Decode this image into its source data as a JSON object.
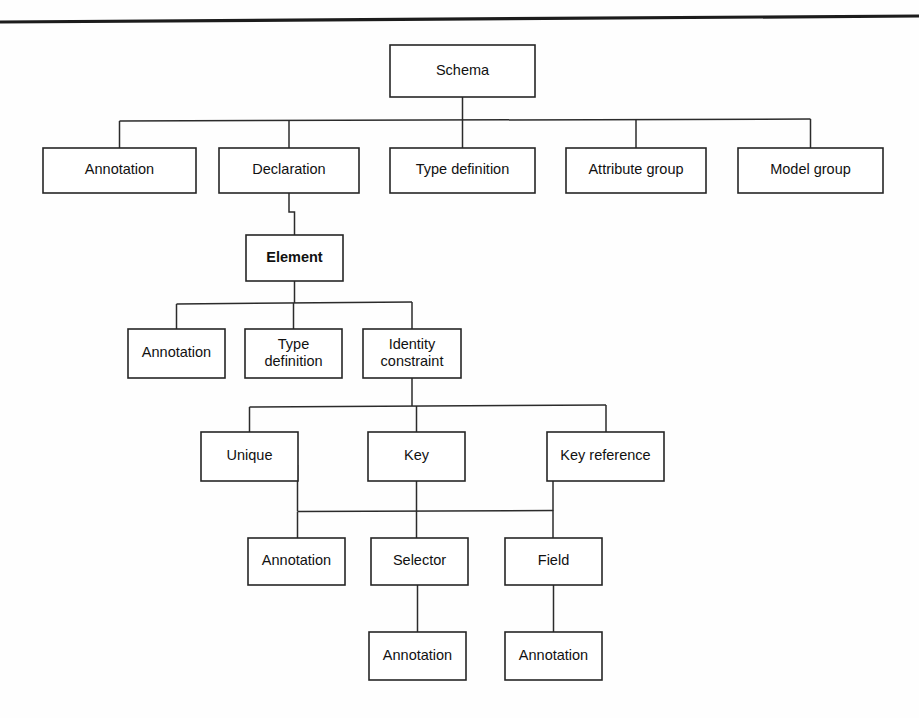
{
  "diagram": {
    "background_color": "#fefefe",
    "line_color": "#2b2b2b",
    "box_fill": "#ffffff",
    "top_rule": {
      "name": "page-header-rule",
      "x1": 0,
      "y1": 22,
      "x2": 919,
      "y2": 16
    },
    "nodes": [
      {
        "id": "schema",
        "label": "Schema",
        "x": 390,
        "y": 45,
        "w": 145,
        "h": 52,
        "bold": false,
        "lines": [
          "Schema"
        ]
      },
      {
        "id": "annotation-1",
        "label": "Annotation",
        "x": 43,
        "y": 148,
        "w": 153,
        "h": 45,
        "bold": false,
        "lines": [
          "Annotation"
        ]
      },
      {
        "id": "declaration",
        "label": "Declaration",
        "x": 219,
        "y": 148,
        "w": 140,
        "h": 45,
        "bold": false,
        "lines": [
          "Declaration"
        ]
      },
      {
        "id": "type-definition-1",
        "label": "Type definition",
        "x": 390,
        "y": 148,
        "w": 145,
        "h": 45,
        "bold": false,
        "lines": [
          "Type definition"
        ]
      },
      {
        "id": "attribute-group",
        "label": "Attribute group",
        "x": 566,
        "y": 148,
        "w": 140,
        "h": 45,
        "bold": false,
        "lines": [
          "Attribute group"
        ]
      },
      {
        "id": "model-group",
        "label": "Model group",
        "x": 738,
        "y": 148,
        "w": 145,
        "h": 45,
        "bold": false,
        "lines": [
          "Model group"
        ]
      },
      {
        "id": "element",
        "label": "Element",
        "x": 246,
        "y": 235,
        "w": 97,
        "h": 46,
        "bold": true,
        "lines": [
          "Element"
        ]
      },
      {
        "id": "annotation-2",
        "label": "Annotation",
        "x": 128,
        "y": 329,
        "w": 97,
        "h": 49,
        "bold": false,
        "lines": [
          "Annotation"
        ]
      },
      {
        "id": "type-definition-2",
        "label": "Type definition",
        "x": 245,
        "y": 329,
        "w": 97,
        "h": 49,
        "bold": false,
        "lines": [
          "Type",
          "definition"
        ]
      },
      {
        "id": "identity-constraint",
        "label": "Identity constraint",
        "x": 363,
        "y": 329,
        "w": 98,
        "h": 49,
        "bold": false,
        "lines": [
          "Identity",
          "constraint"
        ]
      },
      {
        "id": "unique",
        "label": "Unique",
        "x": 201,
        "y": 432,
        "w": 97,
        "h": 49,
        "bold": false,
        "lines": [
          "Unique"
        ]
      },
      {
        "id": "key",
        "label": "Key",
        "x": 368,
        "y": 432,
        "w": 97,
        "h": 49,
        "bold": false,
        "lines": [
          "Key"
        ]
      },
      {
        "id": "key-reference",
        "label": "Key reference",
        "x": 547,
        "y": 432,
        "w": 117,
        "h": 49,
        "bold": false,
        "lines": [
          "Key reference"
        ]
      },
      {
        "id": "annotation-3",
        "label": "Annotation",
        "x": 248,
        "y": 538,
        "w": 97,
        "h": 47,
        "bold": false,
        "lines": [
          "Annotation"
        ]
      },
      {
        "id": "selector",
        "label": "Selector",
        "x": 371,
        "y": 538,
        "w": 97,
        "h": 47,
        "bold": false,
        "lines": [
          "Selector"
        ]
      },
      {
        "id": "field",
        "label": "Field",
        "x": 505,
        "y": 538,
        "w": 97,
        "h": 47,
        "bold": false,
        "lines": [
          "Field"
        ]
      },
      {
        "id": "annotation-4",
        "label": "Annotation",
        "x": 369,
        "y": 632,
        "w": 97,
        "h": 48,
        "bold": false,
        "lines": [
          "Annotation"
        ]
      },
      {
        "id": "annotation-5",
        "label": "Annotation",
        "x": 505,
        "y": 632,
        "w": 97,
        "h": 48,
        "bold": false,
        "lines": [
          "Annotation"
        ]
      }
    ],
    "connectors": [
      {
        "id": "schema-stem",
        "from": "schema",
        "to": "schema-bus",
        "d": "M 462.5 97 L 462.5 120"
      },
      {
        "id": "schema-bus",
        "from": "schema",
        "to": "level1-row",
        "d": "M 119.5 121 L 810.5 119"
      },
      {
        "id": "bus-to-annotation-1",
        "from": "schema-bus",
        "to": "annotation-1",
        "d": "M 119.5 121 L 119.5 148"
      },
      {
        "id": "bus-to-declaration",
        "from": "schema-bus",
        "to": "declaration",
        "d": "M 289 120.5 L 289 148"
      },
      {
        "id": "bus-to-type-definition",
        "from": "schema-bus",
        "to": "type-definition-1",
        "d": "M 462.5 120 L 462.5 148"
      },
      {
        "id": "bus-to-attribute-group",
        "from": "schema-bus",
        "to": "attribute-group",
        "d": "M 636 119.5 L 636 148"
      },
      {
        "id": "bus-to-model-group",
        "from": "schema-bus",
        "to": "model-group",
        "d": "M 810.5 119 L 810.5 148"
      },
      {
        "id": "declaration-to-element",
        "from": "declaration",
        "to": "element",
        "d": "M 289 193 L 289 212 L 294.5 212 L 294.5 235"
      },
      {
        "id": "element-stem",
        "from": "element",
        "to": "element-bus",
        "d": "M 294.5 281 L 294.5 303"
      },
      {
        "id": "element-bus",
        "from": "element",
        "to": "element-children",
        "d": "M 176.5 304 L 412 302"
      },
      {
        "id": "ebus-to-annotation-2",
        "from": "element-bus",
        "to": "annotation-2",
        "d": "M 176.5 304 L 176.5 329"
      },
      {
        "id": "ebus-to-typedef-2",
        "from": "element-bus",
        "to": "type-definition-2",
        "d": "M 293.5 303 L 293.5 329"
      },
      {
        "id": "ebus-to-identity",
        "from": "element-bus",
        "to": "identity-constraint",
        "d": "M 412 302 L 412 329"
      },
      {
        "id": "identity-stem",
        "from": "identity-constraint",
        "to": "identity-bus",
        "d": "M 412 378 L 412 406"
      },
      {
        "id": "identity-bus",
        "from": "identity-constraint",
        "to": "constraint-children",
        "d": "M 249.5 407 L 606 405"
      },
      {
        "id": "ibus-to-unique",
        "from": "identity-bus",
        "to": "unique",
        "d": "M 249.5 407 L 249.5 432"
      },
      {
        "id": "ibus-to-key",
        "from": "identity-bus",
        "to": "key",
        "d": "M 416.5 406 L 416.5 432"
      },
      {
        "id": "ibus-to-key-reference",
        "from": "identity-bus",
        "to": "key-reference",
        "d": "M 606 405 L 606 432"
      },
      {
        "id": "unique-right-drop",
        "from": "unique",
        "to": "leaf-bus",
        "d": "M 297.5 465 L 297.5 511"
      },
      {
        "id": "keyref-left-drop",
        "from": "key-reference",
        "to": "leaf-bus",
        "d": "M 553 465 L 553 511"
      },
      {
        "id": "leaf-bus",
        "from": "unique",
        "to": "key-reference",
        "d": "M 297.5 511.5 L 553 510.5"
      },
      {
        "id": "leafbus-to-annotation-3",
        "from": "leaf-bus",
        "to": "annotation-3",
        "d": "M 297.5 511.5 L 297.5 538"
      },
      {
        "id": "key-to-selector",
        "from": "key",
        "to": "selector",
        "d": "M 416.5 481 L 416.5 538"
      },
      {
        "id": "leafbus-to-field",
        "from": "leaf-bus",
        "to": "field",
        "d": "M 553 510.5 L 553 538"
      },
      {
        "id": "selector-to-annotation",
        "from": "selector",
        "to": "annotation-4",
        "d": "M 417.5 585 L 417.5 632"
      },
      {
        "id": "field-to-annotation",
        "from": "field",
        "to": "annotation-5",
        "d": "M 553.5 585 L 553.5 632"
      }
    ]
  }
}
